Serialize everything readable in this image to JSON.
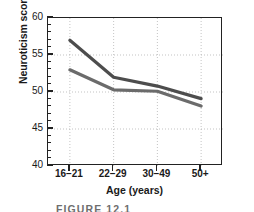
{
  "caption": "FIGURE 12.1",
  "chart_data": {
    "type": "line",
    "title": "",
    "xlabel": "Age (years)",
    "ylabel": "Neuroticism score",
    "categories": [
      "16–21",
      "22–29",
      "30–49",
      "50+"
    ],
    "ylim": [
      40,
      60
    ],
    "ytick_labels": [
      "40",
      "45",
      "50",
      "55",
      "60"
    ],
    "ytick_values": [
      40,
      45,
      50,
      55,
      60
    ],
    "yminor_step": 1,
    "grid": "dotted",
    "legend": "none",
    "series": [
      {
        "name": "series-1",
        "color": "#4d4d4d",
        "values": [
          57.0,
          52.0,
          50.8,
          49.1
        ]
      },
      {
        "name": "series-2",
        "color": "#6b6b6b",
        "values": [
          53.0,
          50.3,
          50.1,
          48.1
        ]
      }
    ]
  }
}
